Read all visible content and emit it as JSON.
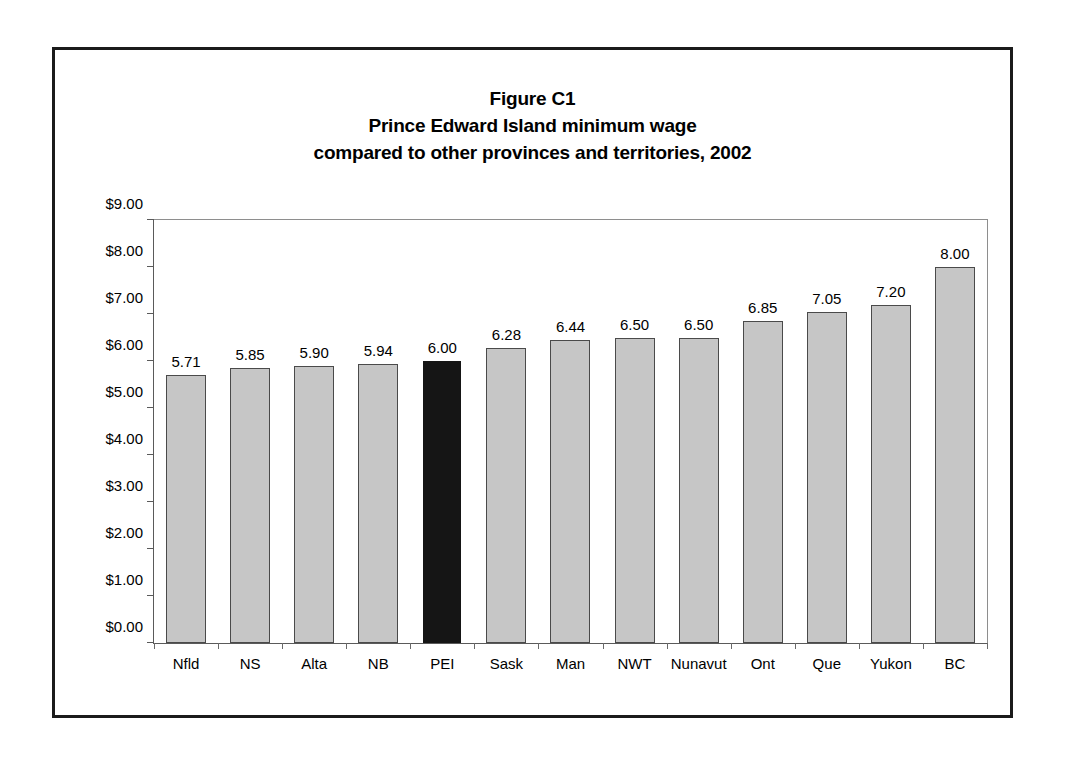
{
  "figure": {
    "title_lines": [
      "Figure C1",
      "Prince Edward Island minimum wage",
      "compared to other provinces and territories, 2002"
    ]
  },
  "chart_data": {
    "type": "bar",
    "xlabel": "",
    "ylabel": "",
    "ylim": [
      0,
      9
    ],
    "ytick_step": 1,
    "ytick_labels": [
      "$0.00",
      "$1.00",
      "$2.00",
      "$3.00",
      "$4.00",
      "$5.00",
      "$6.00",
      "$7.00",
      "$8.00",
      "$9.00"
    ],
    "ytick_values": [
      0,
      1,
      2,
      3,
      4,
      5,
      6,
      7,
      8,
      9
    ],
    "grid": false,
    "legend": null,
    "categories": [
      "Nfld",
      "NS",
      "Alta",
      "NB",
      "PEI",
      "Sask",
      "Man",
      "NWT",
      "Nunavut",
      "Ont",
      "Que",
      "Yukon",
      "BC"
    ],
    "values": [
      5.71,
      5.85,
      5.9,
      5.94,
      6.0,
      6.28,
      6.44,
      6.5,
      6.5,
      6.85,
      7.05,
      7.2,
      8.0
    ],
    "value_labels": [
      "5.71",
      "5.85",
      "5.90",
      "5.94",
      "6.00",
      "6.28",
      "6.44",
      "6.50",
      "6.50",
      "6.85",
      "7.05",
      "7.20",
      "8.00"
    ],
    "highlight_category": "PEI",
    "highlight_index": 4,
    "colors": {
      "bar_fill": "#c6c6c6",
      "bar_border": "#4a4a4a",
      "highlight_fill": "#151515",
      "axis": "#5a5a5a",
      "text": "#000000",
      "frame": "#1b1b1b",
      "background": "#ffffff"
    }
  }
}
